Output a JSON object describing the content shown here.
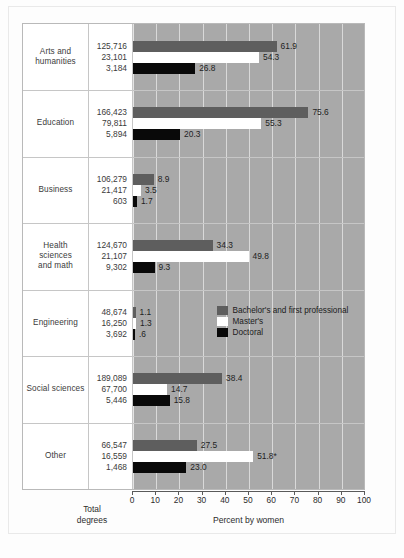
{
  "chart_data": {
    "type": "bar",
    "title": "",
    "xlabel": "Percent by women",
    "ylabel": "",
    "xlim": [
      0,
      100
    ],
    "grid": true,
    "orientation": "horizontal",
    "legend_position": "inside-engineering-row",
    "totals_caption": "Total\ndegrees",
    "totals_caption_line1": "Total",
    "totals_caption_line2": "degrees",
    "xticks": [
      0,
      10,
      20,
      30,
      40,
      50,
      60,
      70,
      80,
      90,
      100
    ],
    "xtick_labels": [
      "0",
      "10",
      "20",
      "30",
      "40",
      "50",
      "60",
      "70",
      "80",
      "90",
      "100"
    ],
    "series": [
      {
        "name": "Bachelor's and first professional",
        "key": "bachelor",
        "color": "#5e5e5e"
      },
      {
        "name": "Master's",
        "key": "master",
        "color": "#ffffff"
      },
      {
        "name": "Doctoral",
        "key": "doctoral",
        "color": "#090909"
      }
    ],
    "categories": [
      "Arts and humanities",
      "Education",
      "Business",
      "Health sciences and math",
      "Engineering",
      "Social sciences",
      "Other"
    ],
    "rows": [
      {
        "label_lines": [
          "Arts and",
          "humanities"
        ],
        "bars": [
          {
            "series": "bachelor",
            "total": "125,716",
            "value": 61.9,
            "label": "61.9"
          },
          {
            "series": "master",
            "total": "23,101",
            "value": 54.3,
            "label": "54.3"
          },
          {
            "series": "doctoral",
            "total": "3,184",
            "value": 26.8,
            "label": "26.8"
          }
        ]
      },
      {
        "label_lines": [
          "Education"
        ],
        "bars": [
          {
            "series": "bachelor",
            "total": "166,423",
            "value": 75.6,
            "label": "75.6"
          },
          {
            "series": "master",
            "total": "79,811",
            "value": 55.3,
            "label": "55.3"
          },
          {
            "series": "doctoral",
            "total": "5,894",
            "value": 20.3,
            "label": "20.3"
          }
        ]
      },
      {
        "label_lines": [
          "Business"
        ],
        "bars": [
          {
            "series": "bachelor",
            "total": "106,279",
            "value": 8.9,
            "label": "8.9"
          },
          {
            "series": "master",
            "total": "21,417",
            "value": 3.5,
            "label": "3.5"
          },
          {
            "series": "doctoral",
            "total": "603",
            "value": 1.7,
            "label": "1.7"
          }
        ]
      },
      {
        "label_lines": [
          "Health",
          "sciences",
          "and math"
        ],
        "bars": [
          {
            "series": "bachelor",
            "total": "124,670",
            "value": 34.3,
            "label": "34.3"
          },
          {
            "series": "master",
            "total": "21,107",
            "value": 49.8,
            "label": "49.8"
          },
          {
            "series": "doctoral",
            "total": "9,302",
            "value": 9.3,
            "label": "9.3"
          }
        ]
      },
      {
        "label_lines": [
          "Engineering"
        ],
        "bars": [
          {
            "series": "bachelor",
            "total": "48,674",
            "value": 1.1,
            "label": "1.1"
          },
          {
            "series": "master",
            "total": "16,250",
            "value": 1.3,
            "label": "1.3"
          },
          {
            "series": "doctoral",
            "total": "3,692",
            "value": 0.6,
            "label": ".6"
          }
        ]
      },
      {
        "label_lines": [
          "Social sciences"
        ],
        "bars": [
          {
            "series": "bachelor",
            "total": "189,089",
            "value": 38.4,
            "label": "38.4"
          },
          {
            "series": "master",
            "total": "67,700",
            "value": 14.7,
            "label": "14.7"
          },
          {
            "series": "doctoral",
            "total": "5,446",
            "value": 15.8,
            "label": "15.8"
          }
        ]
      },
      {
        "label_lines": [
          "Other"
        ],
        "bars": [
          {
            "series": "bachelor",
            "total": "66,547",
            "value": 27.5,
            "label": "27.5"
          },
          {
            "series": "master",
            "total": "16,559",
            "value": 51.8,
            "label": "51.8*"
          },
          {
            "series": "doctoral",
            "total": "1,468",
            "value": 23.0,
            "label": "23.0"
          }
        ]
      }
    ],
    "legend": {
      "in_row_index": 4,
      "entries": [
        "Bachelor's and first professional",
        "Master's",
        "Doctoral"
      ]
    },
    "colors": {
      "plot_background": "#a9a9a9",
      "gridline": "#e2e2e2",
      "bachelor": "#5e5e5e",
      "master": "#ffffff",
      "doctoral": "#090909",
      "frame": "#b9b9b9",
      "text": "#3b3b3b"
    }
  }
}
